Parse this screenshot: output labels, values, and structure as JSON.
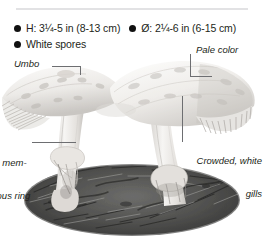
{
  "panel": {
    "subject": "parasol mushroom",
    "divider": "horizontal-rule"
  },
  "facts": [
    {
      "bullet": "filled-circle",
      "text": "H: 3¼-5 in (8-13 cm)"
    },
    {
      "bullet": "filled-circle",
      "text": "Ø: 2¼-6 in (6-15 cm)"
    },
    {
      "bullet": "filled-circle",
      "text": "White spores"
    }
  ],
  "callouts": {
    "umbo": "Umbo",
    "pale_color": "Pale color",
    "membranous_ring_line1": "rge mem-",
    "membranous_ring_line2": "anous ring",
    "gills_line1": "Crowded, white",
    "gills_line2": "gills"
  },
  "colors": {
    "text": "#231f20",
    "rule": "#e2e2e4",
    "leader": "#6d6e71",
    "bullet": "#111111",
    "background": "#ffffff",
    "cap_light": "#f2f0ee",
    "cap_shade": "#cfccc8",
    "stem": "#e8e6e3",
    "debris_dark": "#4a4a4a"
  }
}
